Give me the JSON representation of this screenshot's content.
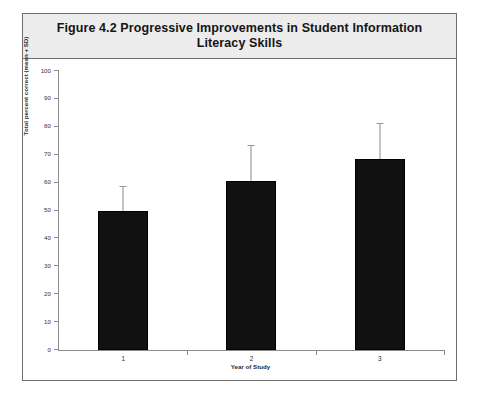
{
  "figure": {
    "title_line1": "Figure 4.2  Progressive Improvements in Student Information",
    "title_line2": "Literacy Skills"
  },
  "chart_data": {
    "type": "bar",
    "title": "Figure 4.2  Progressive Improvements in Student Information Literacy Skills",
    "xlabel": "Year of Study",
    "ylabel": "Total percent correct (mean + SD)",
    "categories": [
      "1",
      "2",
      "3"
    ],
    "values": [
      50,
      60.5,
      68.5
    ],
    "errors": [
      8.5,
      12.5,
      12.5
    ],
    "error_tops": [
      58.5,
      73,
      81
    ],
    "ylim": [
      0,
      100
    ],
    "yticks": [
      0,
      10,
      20,
      30,
      40,
      50,
      60,
      70,
      80,
      90,
      100
    ],
    "ytick_labels": [
      "0",
      "10",
      "20",
      "30",
      "40",
      "50",
      "60",
      "70",
      "80",
      "90",
      "100"
    ],
    "grid": false,
    "legend": false,
    "bar_color": "#111111",
    "error_color": "#8a8a8a",
    "axis_color": "#8c8c8c",
    "title_band_color": "#ececec",
    "frame_color": "#6f6f6f"
  }
}
